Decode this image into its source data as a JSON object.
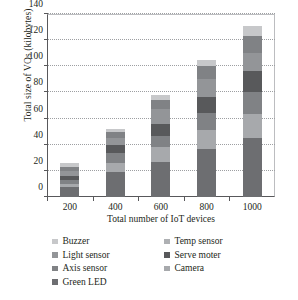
{
  "chart_data": {
    "type": "bar",
    "stacked": true,
    "title": "",
    "xlabel": "Total number of IoT devices",
    "ylabel": "Total size of VOs (kilobytes)",
    "categories": [
      "200",
      "400",
      "600",
      "800",
      "1000"
    ],
    "ylim": [
      0,
      140
    ],
    "yticks": [
      0,
      20,
      40,
      60,
      80,
      100,
      120,
      140
    ],
    "ytick_labels": [
      "0",
      "20",
      "40",
      "60",
      "80",
      "100",
      "120",
      "140"
    ],
    "grid": "horizontal-dotted",
    "legend_position": "below-two-columns",
    "series": [
      {
        "name": "Green LED",
        "color": "#6d6e71",
        "values": [
          7.5,
          19.5,
          26.5,
          36.5,
          45.5
        ]
      },
      {
        "name": "Camera",
        "color": "#a7a9ac",
        "values": [
          2.5,
          6.5,
          12.0,
          15.0,
          18.0
        ]
      },
      {
        "name": "Axis sensor",
        "color": "#808285",
        "values": [
          3.0,
          8.0,
          8.5,
          12.5,
          16.5
        ]
      },
      {
        "name": "Serve moter",
        "color": "#58595b",
        "values": [
          3.0,
          6.0,
          9.0,
          12.5,
          16.5
        ]
      },
      {
        "name": "Light sensor",
        "color": "#939598",
        "values": [
          4.0,
          5.5,
          11.5,
          14.0,
          13.5
        ]
      },
      {
        "name": "Temp sensor",
        "color": "#808285",
        "values": [
          3.0,
          4.0,
          7.0,
          10.0,
          13.0
        ]
      },
      {
        "name": "Buzzer",
        "color": "#c7c8ca",
        "values": [
          3.0,
          2.5,
          3.5,
          4.5,
          8.0
        ]
      }
    ],
    "totals": [
      26,
      52,
      78,
      105,
      131
    ]
  },
  "legend": {
    "entries": [
      {
        "label": "Buzzer",
        "color": "#c7c8ca"
      },
      {
        "label": "Temp sensor",
        "color": "#aeb0b3"
      },
      {
        "label": "Light sensor",
        "color": "#939598"
      },
      {
        "label": "Serve moter",
        "color": "#58595b"
      },
      {
        "label": "Axis sensor",
        "color": "#808285"
      },
      {
        "label": "Camera",
        "color": "#a7a9ac"
      },
      {
        "label": "Green LED",
        "color": "#6d6e71"
      }
    ]
  }
}
